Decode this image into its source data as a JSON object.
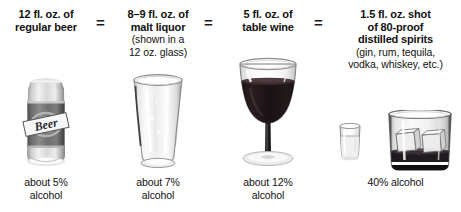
{
  "poster": {
    "title": "Standard drink equivalents",
    "operator": "=",
    "columns": [
      {
        "id": "regular-beer",
        "heading_lines": [
          "12 fl. oz. of",
          "regular beer"
        ],
        "subnote_lines": [],
        "footer_lines": [
          "about 5%",
          "alcohol"
        ],
        "vessel": "beer-can",
        "can_label_text": "Beer",
        "abv_percent": 5,
        "volume_oz": 12
      },
      {
        "id": "malt-liquor",
        "heading_lines": [
          "8–9 fl. oz. of",
          "malt liquor"
        ],
        "subnote_lines": [
          "(shown in a",
          "12 oz. glass)"
        ],
        "footer_lines": [
          "about 7%",
          "alcohol"
        ],
        "vessel": "pilsner-glass",
        "abv_percent": 7,
        "volume_oz": 8.5
      },
      {
        "id": "table-wine",
        "heading_lines": [
          "5 fl. oz. of",
          "table wine"
        ],
        "subnote_lines": [],
        "footer_lines": [
          "about 12%",
          "alcohol"
        ],
        "vessel": "wine-glass",
        "abv_percent": 12,
        "volume_oz": 5
      },
      {
        "id": "distilled-spirits",
        "heading_lines": [
          "1.5 fl. oz. shot",
          "of 80-proof",
          "distilled spirits"
        ],
        "subnote_lines": [
          "(gin, rum, tequila,",
          "vodka, whiskey, etc.)"
        ],
        "footer_lines": [
          "40% alcohol"
        ],
        "vessel": "shot-and-tumbler",
        "abv_percent": 40,
        "volume_oz": 1.5
      }
    ],
    "colors": {
      "background": "#ffffff",
      "text": "#111111",
      "wine": "#1d1416",
      "whiskey": "#242024",
      "can_body": "#6e6e6e",
      "can_metal": "#c9c9c9",
      "glass_outline": "#8c8c8c"
    }
  }
}
